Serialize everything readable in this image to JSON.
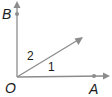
{
  "diagram": {
    "type": "angle-diagram",
    "vertex": {
      "label": "O",
      "x": 17,
      "y": 77
    },
    "rays": [
      {
        "name": "ray-OB",
        "end": {
          "x": 17,
          "y": 2
        },
        "point": {
          "label": "B",
          "x": 17,
          "y": 14
        }
      },
      {
        "name": "ray-OA",
        "end": {
          "x": 109,
          "y": 76
        },
        "point": {
          "label": "A",
          "x": 94,
          "y": 76
        }
      },
      {
        "name": "ray-diagonal",
        "end": {
          "x": 83,
          "y": 37
        }
      }
    ],
    "angles": [
      {
        "label": "1",
        "between": "OA and diagonal"
      },
      {
        "label": "2",
        "between": "diagonal and OB"
      }
    ],
    "colors": {
      "line": "#8c8c8c",
      "text": "#1a1a1a"
    }
  },
  "labels": {
    "B": "B",
    "O": "O",
    "A": "A",
    "angle1": "1",
    "angle2": "2"
  }
}
